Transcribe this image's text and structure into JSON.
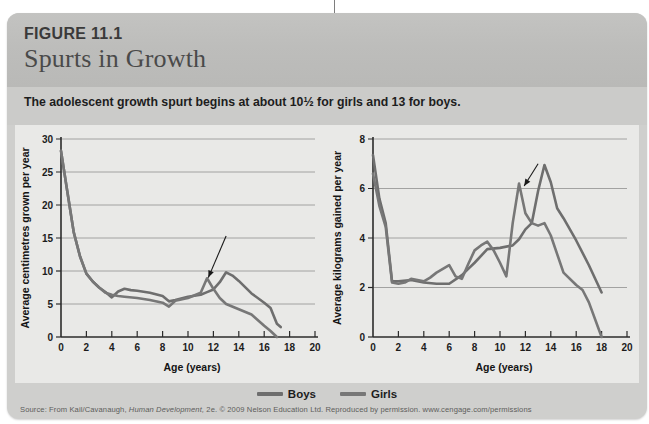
{
  "page": {
    "background": "#ffffff",
    "card_background": "#cfcfcd",
    "header_background": "#bdbdbb"
  },
  "header": {
    "figure_number": "FIGURE 11.1",
    "title": "Spurts in Growth"
  },
  "caption": {
    "text": "The adolescent growth spurt begins at about 10½ for girls and 13 for boys."
  },
  "legend": {
    "position": "bottom-center",
    "items": [
      {
        "label": "Boys",
        "color": "#6e6e6e"
      },
      {
        "label": "Girls",
        "color": "#777777"
      }
    ]
  },
  "source": {
    "prefix": "Source: From Kail/Cavanaugh,",
    "italic_title": "Human Development,",
    "suffix": "2e. © 2009 Nelson Education Ltd. Reproduced by permission. www.cengage.com/permissions"
  },
  "chart_data": [
    {
      "id": "height-velocity",
      "type": "line",
      "title": "",
      "xlabel": "Age (years)",
      "ylabel": "Average centimetres grown per year",
      "xlim": [
        0,
        20
      ],
      "ylim": [
        0,
        30
      ],
      "xticks": [
        0,
        2,
        4,
        6,
        8,
        10,
        12,
        14,
        16,
        18,
        20
      ],
      "yticks": [
        0,
        5,
        10,
        15,
        20,
        25,
        30
      ],
      "grid": "horizontal",
      "annotation": {
        "text": "",
        "points_to_x": 11.6,
        "points_to_y": 9.0,
        "from_x": 13.0,
        "from_y": 15.3
      },
      "series": [
        {
          "name": "Boys",
          "color": "#6e6e6e",
          "x": [
            0,
            0.5,
            1,
            1.5,
            2,
            2.5,
            3,
            3.5,
            4,
            4.5,
            5,
            5.5,
            6,
            7,
            8,
            8.5,
            9,
            10,
            11,
            11.5,
            12,
            12.5,
            13,
            13.5,
            14,
            15,
            16,
            16.5,
            17,
            17.3
          ],
          "y": [
            28.2,
            22.0,
            15.9,
            12.2,
            9.6,
            8.4,
            7.5,
            6.8,
            6.0,
            6.9,
            7.3,
            7.1,
            7.0,
            6.7,
            6.2,
            5.4,
            5.6,
            6.1,
            6.4,
            6.8,
            7.2,
            8.3,
            9.8,
            9.3,
            8.5,
            6.6,
            5.2,
            4.4,
            2.0,
            1.5
          ]
        },
        {
          "name": "Girls",
          "color": "#777777",
          "x": [
            0,
            0.5,
            1,
            1.5,
            2,
            2.5,
            3,
            3.5,
            4,
            4.5,
            5,
            6,
            7,
            8,
            8.5,
            9,
            10,
            11,
            11.5,
            12,
            12.5,
            13,
            14,
            15,
            16,
            16.5,
            17
          ],
          "y": [
            28.2,
            22.0,
            15.9,
            12.2,
            9.6,
            8.4,
            7.5,
            6.7,
            6.4,
            6.2,
            6.1,
            5.9,
            5.6,
            5.2,
            4.6,
            5.5,
            5.9,
            6.7,
            8.9,
            7.3,
            5.9,
            5.0,
            4.2,
            3.4,
            1.7,
            0.9,
            0.0
          ]
        }
      ]
    },
    {
      "id": "weight-velocity",
      "type": "line",
      "title": "",
      "xlabel": "Age (years)",
      "ylabel": "Average kilograms gained per year",
      "xlim": [
        0,
        20
      ],
      "ylim": [
        0,
        8
      ],
      "xticks": [
        0,
        2,
        4,
        6,
        8,
        10,
        12,
        14,
        16,
        18,
        20
      ],
      "yticks": [
        0,
        2,
        4,
        6,
        8
      ],
      "grid": "horizontal",
      "annotation": {
        "text": "",
        "points_to_x": 11.9,
        "points_to_y": 6.1,
        "from_x": 13.0,
        "from_y": 7.0
      },
      "series": [
        {
          "name": "Boys",
          "color": "#6e6e6e",
          "x": [
            0,
            0.5,
            1,
            1.5,
            2,
            3,
            4,
            5,
            6,
            7,
            7.5,
            8,
            9,
            10,
            11,
            11.5,
            12,
            12.5,
            13,
            13.5,
            14,
            14.5,
            15,
            16,
            17,
            18
          ],
          "y": [
            7.35,
            5.6,
            4.6,
            2.25,
            2.25,
            2.3,
            2.2,
            2.15,
            2.15,
            2.5,
            2.75,
            3.0,
            3.55,
            3.6,
            3.7,
            3.95,
            4.35,
            4.6,
            5.9,
            6.95,
            6.25,
            5.2,
            4.8,
            3.9,
            2.9,
            1.8
          ]
        },
        {
          "name": "Girls",
          "color": "#777777",
          "x": [
            0,
            0.5,
            1,
            1.5,
            2,
            2.5,
            3,
            4,
            4.5,
            5,
            6,
            6.5,
            7,
            7.5,
            8,
            8.5,
            9,
            9.5,
            10,
            10.5,
            11,
            11.5,
            12,
            12.5,
            13,
            13.5,
            14,
            15,
            16,
            16.5,
            17,
            18
          ],
          "y": [
            6.6,
            5.3,
            4.45,
            2.2,
            2.15,
            2.2,
            2.35,
            2.25,
            2.4,
            2.6,
            2.9,
            2.45,
            2.35,
            2.95,
            3.5,
            3.7,
            3.85,
            3.5,
            3.0,
            2.45,
            4.6,
            6.2,
            5.0,
            4.6,
            4.5,
            4.6,
            4.1,
            2.6,
            2.1,
            1.9,
            1.4,
            0.0
          ]
        }
      ]
    }
  ]
}
